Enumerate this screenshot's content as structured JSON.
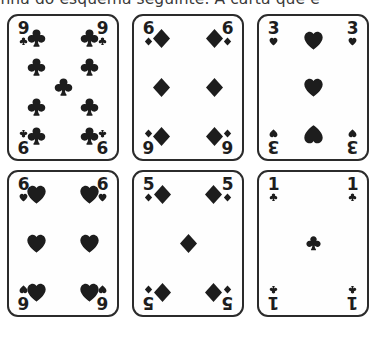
{
  "caption": {
    "text": "inha do esquema seguinte. A carta que e"
  },
  "colors": {
    "ink": "#1d1d1d",
    "border": "#2b2b2b",
    "card_face": "#fefefe",
    "page_background": "#ffffff"
  },
  "deck": {
    "style": "monochrome-print",
    "rows": 2,
    "columns": 3,
    "cards": [
      {
        "id": "card-9-clubs",
        "rank": "9",
        "suit": "clubs",
        "suit_symbol": "♣",
        "pip_count": 9,
        "layout": "column-4-4-center-1",
        "position": {
          "row": 1,
          "column": 1
        }
      },
      {
        "id": "card-6-diamonds",
        "rank": "6",
        "suit": "diamonds",
        "suit_symbol": "♦",
        "pip_count": 6,
        "layout": "two-columns-of-3",
        "position": {
          "row": 1,
          "column": 2
        }
      },
      {
        "id": "card-3-hearts",
        "rank": "3",
        "suit": "hearts",
        "suit_symbol": "♥",
        "pip_count": 3,
        "layout": "center-column-of-3",
        "position": {
          "row": 1,
          "column": 3
        }
      },
      {
        "id": "card-6-hearts",
        "rank": "6",
        "suit": "hearts",
        "suit_symbol": "♥",
        "pip_count": 6,
        "layout": "two-columns-of-3",
        "position": {
          "row": 2,
          "column": 1
        }
      },
      {
        "id": "card-5-diamonds",
        "rank": "5",
        "suit": "diamonds",
        "suit_symbol": "♦",
        "pip_count": 5,
        "layout": "four-corners-plus-center",
        "position": {
          "row": 2,
          "column": 2
        }
      },
      {
        "id": "card-1-clubs",
        "rank": "1",
        "suit": "clubs",
        "suit_symbol": "♣",
        "pip_count": 1,
        "layout": "single-center",
        "position": {
          "row": 2,
          "column": 3
        }
      }
    ]
  }
}
